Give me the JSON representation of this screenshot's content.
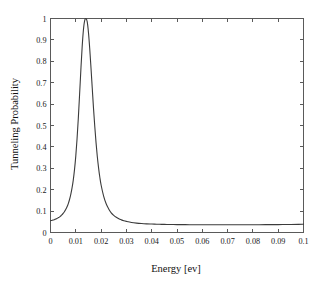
{
  "figure": {
    "background_color": "#ffffff",
    "axes_color": "#5a5a5a",
    "curve_color": "#3b3b3b"
  },
  "chart_data": {
    "type": "line",
    "title": "",
    "xlabel": "Energy [ev]",
    "ylabel": "Tunneling Probability",
    "xlim": [
      0,
      0.1
    ],
    "ylim": [
      0,
      1
    ],
    "grid": false,
    "legend": false,
    "xticks": [
      0,
      0.01,
      0.02,
      0.03,
      0.04,
      0.05,
      0.06,
      0.07,
      0.08,
      0.09,
      0.1
    ],
    "xticklabels": [
      "0",
      "0.01",
      "0.02",
      "0.03",
      "0.04",
      "0.05",
      "0.06",
      "0.07",
      "0.08",
      "0.09",
      "0.1"
    ],
    "yticks": [
      0,
      0.1,
      0.2,
      0.3,
      0.4,
      0.5,
      0.6,
      0.7,
      0.8,
      0.9,
      1
    ],
    "yticklabels": [
      "0",
      "0.1",
      "0.2",
      "0.3",
      "0.4",
      "0.5",
      "0.6",
      "0.7",
      "0.8",
      "0.9",
      "1"
    ],
    "series": [
      {
        "name": "Tunneling Probability",
        "resonance_peak_energy": 0.0145,
        "resonance_peak_value": 1.0,
        "value_at_zero": 0.055,
        "tail_baseline": 0.037,
        "x": [
          0.0,
          0.0005,
          0.001,
          0.0015,
          0.002,
          0.0025,
          0.003,
          0.0035,
          0.004,
          0.0045,
          0.005,
          0.0055,
          0.006,
          0.0065,
          0.007,
          0.0075,
          0.008,
          0.0085,
          0.009,
          0.0095,
          0.01,
          0.0105,
          0.011,
          0.0115,
          0.012,
          0.0125,
          0.013,
          0.0135,
          0.014,
          0.0145,
          0.015,
          0.0155,
          0.016,
          0.0165,
          0.017,
          0.0175,
          0.018,
          0.0185,
          0.019,
          0.0195,
          0.02,
          0.021,
          0.022,
          0.023,
          0.024,
          0.025,
          0.026,
          0.027,
          0.028,
          0.029,
          0.03,
          0.032,
          0.034,
          0.036,
          0.038,
          0.04,
          0.042,
          0.044,
          0.046,
          0.048,
          0.05,
          0.055,
          0.06,
          0.065,
          0.07,
          0.075,
          0.08,
          0.085,
          0.09,
          0.095,
          0.098,
          0.1
        ],
        "y": [
          0.055,
          0.0565,
          0.058,
          0.06,
          0.0625,
          0.065,
          0.0685,
          0.072,
          0.077,
          0.082,
          0.089,
          0.097,
          0.107,
          0.119,
          0.134,
          0.153,
          0.177,
          0.207,
          0.245,
          0.295,
          0.358,
          0.438,
          0.535,
          0.645,
          0.76,
          0.865,
          0.945,
          0.99,
          1.0,
          0.985,
          0.935,
          0.86,
          0.77,
          0.675,
          0.58,
          0.495,
          0.42,
          0.355,
          0.302,
          0.258,
          0.222,
          0.17,
          0.134,
          0.11,
          0.092,
          0.08,
          0.071,
          0.064,
          0.059,
          0.055,
          0.052,
          0.047,
          0.044,
          0.042,
          0.0405,
          0.0395,
          0.0387,
          0.0381,
          0.0376,
          0.0372,
          0.0369,
          0.0364,
          0.0361,
          0.036,
          0.036,
          0.0361,
          0.0363,
          0.0366,
          0.037,
          0.0376,
          0.0382,
          0.039
        ]
      }
    ]
  }
}
